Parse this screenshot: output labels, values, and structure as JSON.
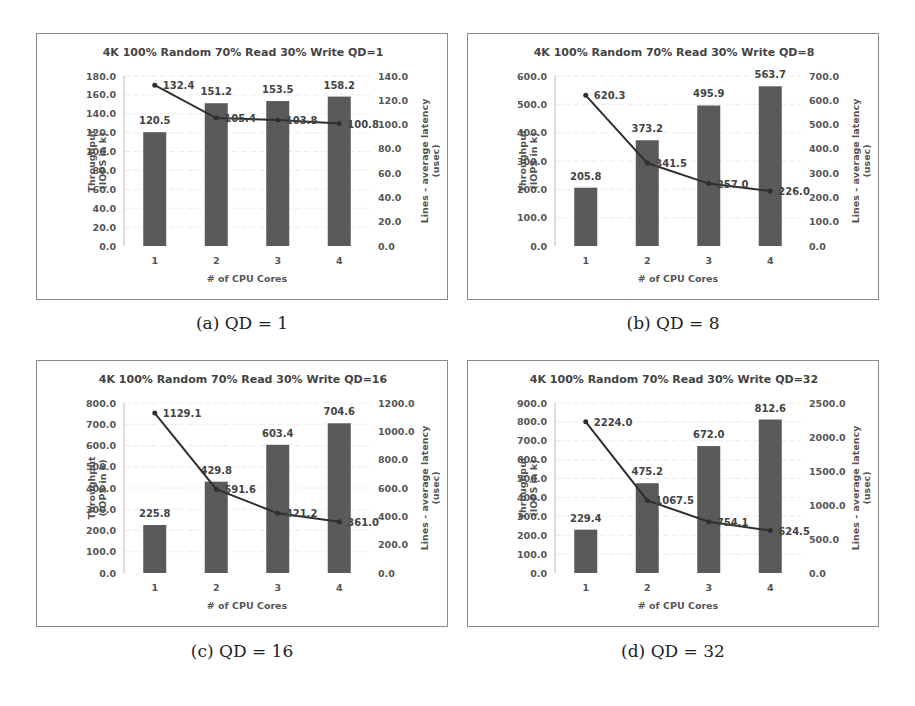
{
  "figure": {
    "panels": [
      {
        "id": "a",
        "caption": "(a) QD = 1"
      },
      {
        "id": "b",
        "caption": "(b) QD = 8"
      },
      {
        "id": "c",
        "caption": "(c) QD = 16"
      },
      {
        "id": "d",
        "caption": "(d) QD = 32"
      }
    ]
  },
  "chart_data": [
    {
      "type": "bar+line",
      "title": "4K 100% Random 70% Read 30% Write QD=1",
      "xlabel": "# of CPU Cores",
      "ylabel": "Throughput (IOPS in k)",
      "y2label": "Lines - average latency (usec)",
      "categories": [
        "1",
        "2",
        "3",
        "4"
      ],
      "series": [
        {
          "name": "Throughput (IOPS in k)",
          "kind": "bar",
          "axis": "left",
          "values": [
            120.5,
            151.2,
            153.5,
            158.2
          ]
        },
        {
          "name": "Average latency (usec)",
          "kind": "line",
          "axis": "right",
          "values": [
            132.4,
            105.4,
            103.8,
            100.8
          ]
        }
      ],
      "ylim": [
        0,
        180
      ],
      "yticks": [
        "0.0",
        "20.0",
        "40.0",
        "60.0",
        "80.0",
        "100.0",
        "120.0",
        "140.0",
        "160.0",
        "180.0"
      ],
      "y2lim": [
        0,
        140
      ],
      "y2ticks": [
        "0.0",
        "20.0",
        "40.0",
        "60.0",
        "80.0",
        "100.0",
        "120.0",
        "140.0"
      ],
      "grid": true,
      "legend": "none",
      "colors": {
        "bar": "#5a5a5a",
        "line": "#2f2f2f"
      }
    },
    {
      "type": "bar+line",
      "title": "4K 100% Random 70% Read 30% Write QD=8",
      "xlabel": "# of CPU Cores",
      "ylabel": "Throughput (IOPS in k)",
      "y2label": "Lines - average latency (usec)",
      "categories": [
        "1",
        "2",
        "3",
        "4"
      ],
      "series": [
        {
          "name": "Throughput (IOPS in k)",
          "kind": "bar",
          "axis": "left",
          "values": [
            205.8,
            373.2,
            495.9,
            563.7
          ]
        },
        {
          "name": "Average latency (usec)",
          "kind": "line",
          "axis": "right",
          "values": [
            620.3,
            341.5,
            257.0,
            226.0
          ]
        }
      ],
      "ylim": [
        0,
        600
      ],
      "yticks": [
        "0.0",
        "100.0",
        "200.0",
        "300.0",
        "400.0",
        "500.0",
        "600.0"
      ],
      "y2lim": [
        0,
        700
      ],
      "y2ticks": [
        "0.0",
        "100.0",
        "200.0",
        "300.0",
        "400.0",
        "500.0",
        "600.0",
        "700.0"
      ],
      "grid": true,
      "legend": "none",
      "colors": {
        "bar": "#5a5a5a",
        "line": "#2f2f2f"
      }
    },
    {
      "type": "bar+line",
      "title": "4K 100% Random 70% Read 30% Write QD=16",
      "xlabel": "# of CPU Cores",
      "ylabel": "Throughput (IOPS in k)",
      "y2label": "Lines - average latency (usec)",
      "categories": [
        "1",
        "2",
        "3",
        "4"
      ],
      "series": [
        {
          "name": "Throughput (IOPS in k)",
          "kind": "bar",
          "axis": "left",
          "values": [
            225.8,
            429.8,
            603.4,
            704.6
          ]
        },
        {
          "name": "Average latency (usec)",
          "kind": "line",
          "axis": "right",
          "values": [
            1129.1,
            591.6,
            421.2,
            361.0
          ]
        }
      ],
      "ylim": [
        0,
        800
      ],
      "yticks": [
        "0.0",
        "100.0",
        "200.0",
        "300.0",
        "400.0",
        "500.0",
        "600.0",
        "700.0",
        "800.0"
      ],
      "y2lim": [
        0,
        1200
      ],
      "y2ticks": [
        "0.0",
        "200.0",
        "400.0",
        "600.0",
        "800.0",
        "1000.0",
        "1200.0"
      ],
      "grid": true,
      "legend": "none",
      "colors": {
        "bar": "#5a5a5a",
        "line": "#2f2f2f"
      }
    },
    {
      "type": "bar+line",
      "title": "4K 100% Random 70% Read 30% Write QD=32",
      "xlabel": "# of CPU Cores",
      "ylabel": "Throughput (IOPS in k)",
      "y2label": "Lines - average latency (usec)",
      "categories": [
        "1",
        "2",
        "3",
        "4"
      ],
      "series": [
        {
          "name": "Throughput (IOPS in k)",
          "kind": "bar",
          "axis": "left",
          "values": [
            229.4,
            475.2,
            672.0,
            812.6
          ]
        },
        {
          "name": "Average latency (usec)",
          "kind": "line",
          "axis": "right",
          "values": [
            2224.0,
            1067.5,
            754.1,
            624.5
          ]
        }
      ],
      "ylim": [
        0,
        900
      ],
      "yticks": [
        "0.0",
        "100.0",
        "200.0",
        "300.0",
        "400.0",
        "500.0",
        "600.0",
        "700.0",
        "800.0",
        "900.0"
      ],
      "y2lim": [
        0,
        2500
      ],
      "y2ticks": [
        "0.0",
        "500.0",
        "1000.0",
        "1500.0",
        "2000.0",
        "2500.0"
      ],
      "grid": true,
      "legend": "none",
      "colors": {
        "bar": "#5a5a5a",
        "line": "#2f2f2f"
      }
    }
  ]
}
